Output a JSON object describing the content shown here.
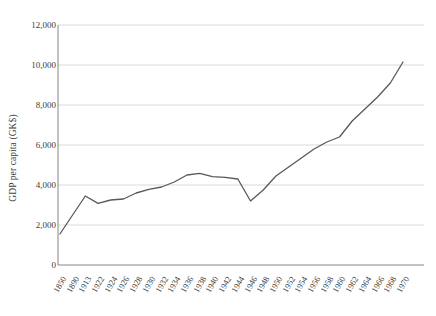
{
  "chart_data": {
    "type": "line",
    "title": "",
    "xlabel": "",
    "ylabel": "GDP per capita (GK$)",
    "ylim": [
      0,
      12000
    ],
    "ytick_labels": [
      "0",
      "2,000",
      "4,000",
      "6,000",
      "8,000",
      "10,000",
      "12,000"
    ],
    "ytick_values": [
      0,
      2000,
      4000,
      6000,
      8000,
      10000,
      12000
    ],
    "grid": "horizontal",
    "legend": "none",
    "line_color": "#595959",
    "gridline_color": "#d9d9d9",
    "axis_color": "#868686",
    "background": "#ffffff",
    "categories": [
      "1850",
      "1890",
      "1913",
      "1922",
      "1924",
      "1926",
      "1928",
      "1930",
      "1932",
      "1934",
      "1936",
      "1938",
      "1940",
      "1942",
      "1944",
      "1946",
      "1948",
      "1950",
      "1952",
      "1954",
      "1956",
      "1958",
      "1960",
      "1962",
      "1964",
      "1966",
      "1968",
      "1970"
    ],
    "values": [
      1550,
      2500,
      3450,
      3080,
      3250,
      3300,
      3600,
      3780,
      3900,
      4150,
      4500,
      4580,
      4420,
      4380,
      4300,
      3200,
      3750,
      4450,
      4900,
      5350,
      5800,
      6150,
      6400,
      7200,
      7800,
      8400,
      9100,
      10150
    ],
    "series": [
      {
        "name": "GDP per capita (GK$)",
        "values": [
          1550,
          2500,
          3450,
          3080,
          3250,
          3300,
          3600,
          3780,
          3900,
          4150,
          4500,
          4580,
          4420,
          4380,
          4300,
          3200,
          3750,
          4450,
          4900,
          5350,
          5800,
          6150,
          6400,
          7200,
          7800,
          8400,
          9100,
          10150
        ]
      }
    ]
  }
}
